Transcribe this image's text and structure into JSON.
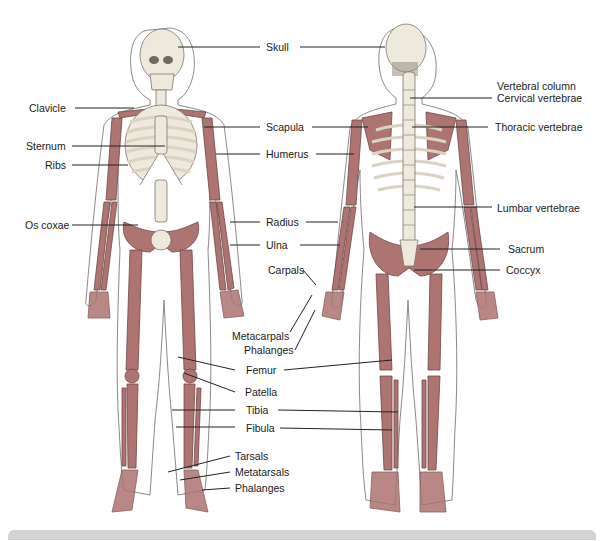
{
  "figure": {
    "colors": {
      "bone_red": "#a8706e",
      "bone_light": "#ece8dc",
      "outline": "#7a7a7a",
      "label": "#1a1a1a",
      "footer": "#d3d3d3"
    }
  },
  "labels": {
    "skull": "Skull",
    "clavicle": "Clavicle",
    "sternum": "Sternum",
    "ribs": "Ribs",
    "os_coxae": "Os coxae",
    "scapula": "Scapula",
    "humerus": "Humerus",
    "radius": "Radius",
    "ulna": "Ulna",
    "carpals": "Carpals",
    "metacarpals": "Metacarpals",
    "phalanges_hand": "Phalanges",
    "femur": "Femur",
    "patella": "Patella",
    "tibia": "Tibia",
    "fibula": "Fibula",
    "tarsals": "Tarsals",
    "metatarsals": "Metatarsals",
    "phalanges_foot": "Phalanges",
    "vertebral_column": "Vertebral column",
    "cervical_vertebrae": "Cervical vertebrae",
    "thoracic_vertebrae": "Thoracic vertebrae",
    "lumbar_vertebrae": "Lumbar vertebrae",
    "sacrum": "Sacrum",
    "coccyx": "Coccyx"
  }
}
